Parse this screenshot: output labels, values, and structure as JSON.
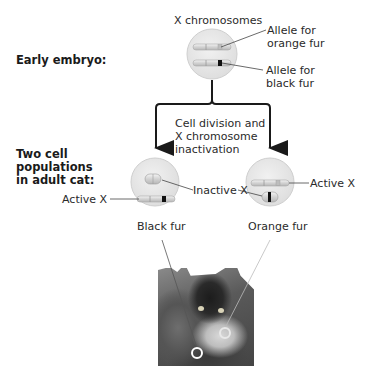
{
  "title_labels": {
    "x_chromosomes": "X chromosomes",
    "early_embryo": "Early embryo:",
    "two_cell_populations": [
      "Two cell",
      "populations",
      "in adult cat:"
    ]
  },
  "embryo_cell": {
    "allele_orange": [
      "Allele for",
      "orange fur"
    ],
    "allele_black": [
      "Allele for",
      "black fur"
    ]
  },
  "process": {
    "label": [
      "Cell division and",
      "X chromosome",
      "inactivation"
    ]
  },
  "left_cell": {
    "active_label": "Active X",
    "result": "Black fur"
  },
  "shared": {
    "inactive_label": "Inactive X"
  },
  "right_cell": {
    "active_label": "Active X",
    "result": "Orange fur"
  },
  "photo": {
    "subject": "tortoiseshell kitten",
    "markers": [
      "black-fur-patch",
      "orange-fur-patch"
    ]
  },
  "colors": {
    "cell_fill": "#e6e6e6",
    "cell_stroke": "#c8c8c8",
    "arrow": "#1a1a1a",
    "leader_line": "#555555",
    "allele_black": "#111111",
    "allele_orange": "#bdbdbd"
  }
}
